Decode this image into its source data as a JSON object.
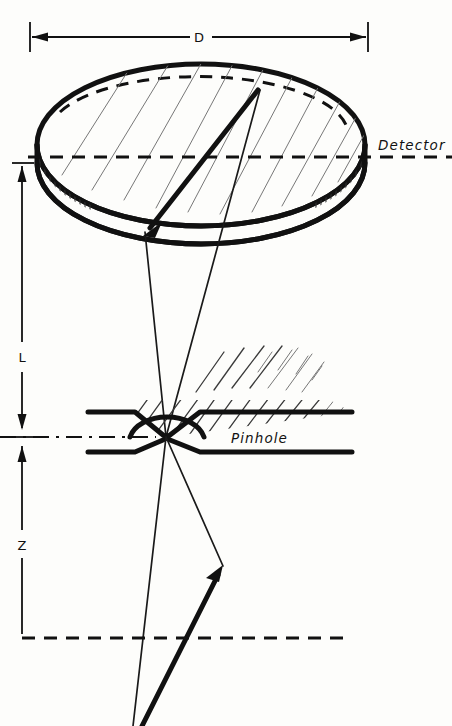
{
  "figure": {
    "kind": "technical-line-diagram",
    "background_color": "#fdfdfb",
    "ink_color": "#111111"
  },
  "labels": {
    "diameter": "D",
    "detector": "Detector",
    "pinhole": "Pinhole",
    "distance_detector_to_pinhole": "L",
    "distance_pinhole_to_source": "Z"
  },
  "dimensions": {
    "diameter_line": {
      "label": "D",
      "y": 37,
      "x_start": 30,
      "x_end": 368,
      "label_x": 199,
      "label_y": 42
    },
    "L_arrow": {
      "label": "L",
      "x": 22,
      "y_top": 163,
      "y_bottom": 437,
      "label_x": 22,
      "label_y": 357
    },
    "Z_arrow": {
      "label": "Z",
      "x": 22,
      "y_top": 437,
      "y_bottom": 638,
      "label_x": 22,
      "label_y": 545
    }
  },
  "detector": {
    "label": "Detector",
    "label_x": 378,
    "label_y": 150,
    "top_ellipse": {
      "cx": 201,
      "cy": 145,
      "rx": 166,
      "ry": 83
    },
    "thickness": 62,
    "back_rim_dashes": true,
    "hatching_on_top_face": true,
    "edge_tick_hatching": true
  },
  "pinhole": {
    "label": "Pinhole",
    "label_x": 231,
    "label_y": 442,
    "aperture_x": 166,
    "aperture_y": 437,
    "plate_upper_y": 412,
    "plate_lower_y": 452,
    "plate_left_x": 88,
    "plate_right_x": 352,
    "dome_rx": 38,
    "dome_ry": 25,
    "hatching_above_plate": true
  },
  "axes": {
    "detector_plane": {
      "style": "dashed",
      "y": 156,
      "x_start": 28,
      "x_end": 452
    },
    "pinhole_plane": {
      "style": "dash-dot",
      "y": 437,
      "x_start": 0,
      "x_end": 250
    },
    "source_plane": {
      "style": "dashed",
      "y": 638,
      "x_start": 22,
      "x_end": 352
    }
  },
  "rays": {
    "cone_upper_left": {
      "x1": 166,
      "y1": 437,
      "x2": 145,
      "y2": 232
    },
    "cone_upper_right": {
      "x1": 166,
      "y1": 437,
      "x2": 260,
      "y2": 90
    },
    "cone_lower_left": {
      "x1": 166,
      "y1": 437,
      "x2": 133,
      "y2": 726
    },
    "cone_lower_right": {
      "x1": 166,
      "y1": 437,
      "x2": 223,
      "y2": 566
    },
    "thick_ray_in_detector": {
      "from_x": 258,
      "from_y": 90,
      "to_x": 145,
      "to_y": 233,
      "arrowhead": "down-left"
    },
    "thick_ray_from_source": {
      "from_x": 142,
      "from_y": 726,
      "to_x": 222,
      "to_y": 567,
      "arrowhead": "up-right"
    }
  }
}
